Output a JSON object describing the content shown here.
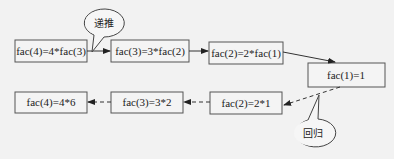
{
  "diagram": {
    "forward_nodes": [
      {
        "label": "fac(4)=4*fac(3)"
      },
      {
        "label": "fac(3)=3*fac(2)"
      },
      {
        "label": "fac(2)=2*fac(1)"
      }
    ],
    "base_node": {
      "label": "fac(1)=1"
    },
    "backward_nodes": [
      {
        "label": "fac(2)=2*1"
      },
      {
        "label": "fac(3)=3*2"
      },
      {
        "label": "fac(4)=4*6"
      }
    ],
    "callouts": {
      "recursion": "递推",
      "return": "回归"
    }
  }
}
